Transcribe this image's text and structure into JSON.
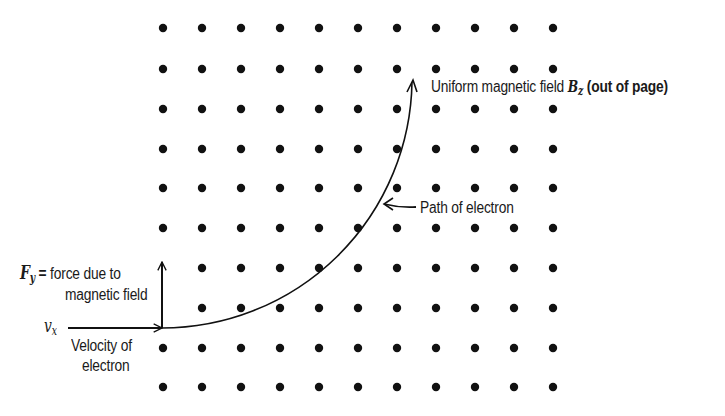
{
  "diagram": {
    "colors": {
      "ink": "#111111",
      "background": "#ffffff"
    },
    "dot_grid": {
      "columns_x": [
        163,
        202,
        241,
        280,
        319,
        358,
        397,
        436,
        475,
        514,
        553
      ],
      "rows_y": [
        28,
        69,
        109,
        149,
        188,
        228,
        268,
        308,
        348,
        387
      ],
      "dot_radius": 4.2,
      "omitted": [
        [
          0,
          6
        ],
        [
          0,
          7
        ]
      ],
      "meaning": "magnetic field lines out of page"
    },
    "electron_path": {
      "start": [
        162,
        328
      ],
      "end": [
        412,
        80
      ],
      "center": [
        162,
        78
      ],
      "label": "Path of electron"
    },
    "force_arrow": {
      "from": [
        162,
        328
      ],
      "to": [
        162,
        262
      ]
    },
    "velocity_arrow": {
      "from": [
        68,
        328
      ],
      "to": [
        162,
        328
      ]
    },
    "path_pointer": {
      "from": [
        416,
        207
      ],
      "to": [
        384,
        204
      ]
    }
  },
  "labels": {
    "field": {
      "prefix": "Uniform magnetic field ",
      "symbol": "B",
      "subscript": "z",
      "suffix": " (out of page)"
    },
    "path": "Path of electron",
    "force": {
      "symbol": "F",
      "subscript": "y",
      "equals": " = ",
      "line1": "force due to",
      "line2": "magnetic field"
    },
    "velocity": {
      "symbol": "v",
      "subscript": "x",
      "line1": "Velocity of",
      "line2": "electron"
    }
  }
}
